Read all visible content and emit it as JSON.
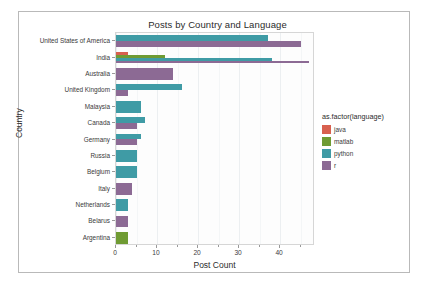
{
  "chart_data": {
    "type": "bar",
    "orientation": "horizontal",
    "grouped": true,
    "title": "Posts by Country and Language",
    "xlabel": "Post Count",
    "ylabel": "Country",
    "xlim": [
      0,
      48.5
    ],
    "x_ticks": [
      0,
      10,
      20,
      30,
      40
    ],
    "x_minor_ticks": [
      5,
      15,
      25,
      35,
      45
    ],
    "grid": true,
    "legend_title": "as.factor(language)",
    "legend_position": "right",
    "categories": [
      "United States of America",
      "India",
      "Australia",
      "United Kingdom",
      "Malaysia",
      "Canada",
      "Germany",
      "Russia",
      "Belgium",
      "Italy",
      "Netherlands",
      "Belarus",
      "Argentina"
    ],
    "series": [
      {
        "name": "java",
        "color": "#d8604f",
        "values": [
          0,
          3,
          0,
          0,
          0,
          0,
          0,
          0,
          0,
          0,
          0,
          0,
          0
        ]
      },
      {
        "name": "matlab",
        "color": "#6f9b33",
        "values": [
          0,
          12,
          0,
          0,
          0,
          0,
          0,
          0,
          0,
          0,
          0,
          0,
          3
        ]
      },
      {
        "name": "python",
        "color": "#3f9ba5",
        "values": [
          37,
          38,
          0,
          16,
          6,
          7,
          6,
          5,
          5,
          0,
          3,
          0,
          0
        ]
      },
      {
        "name": "r",
        "color": "#8c6a94",
        "values": [
          45,
          47,
          14,
          3,
          0,
          5,
          5,
          0,
          0,
          4,
          0,
          3,
          0
        ]
      }
    ]
  },
  "legend": {
    "title": "as.factor(language)",
    "items": [
      {
        "label": "java",
        "color": "#d8604f"
      },
      {
        "label": "matlab",
        "color": "#6f9b33"
      },
      {
        "label": "python",
        "color": "#3f9ba5"
      },
      {
        "label": "r",
        "color": "#8c6a94"
      }
    ]
  },
  "axes": {
    "x_tick_labels": [
      "0",
      "10",
      "20",
      "30",
      "40"
    ],
    "y_tick_labels": [
      "United States of America",
      "India",
      "Australia",
      "United Kingdom",
      "Malaysia",
      "Canada",
      "Germany",
      "Russia",
      "Belgium",
      "Italy",
      "Netherlands",
      "Belarus",
      "Argentina"
    ]
  }
}
